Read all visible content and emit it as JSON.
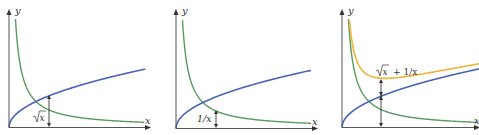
{
  "figure": {
    "panels": [
      {
        "id": "panel-1",
        "axis_labels": {
          "x": "x",
          "y": "y"
        },
        "curves": [
          "sqrt",
          "inverse"
        ],
        "annotation": {
          "label": "√x",
          "target": "sqrt",
          "at_x": 1.48
        }
      },
      {
        "id": "panel-2",
        "axis_labels": {
          "x": "x",
          "y": "y"
        },
        "curves": [
          "sqrt",
          "inverse"
        ],
        "annotation": {
          "label": "1/x",
          "target": "inverse",
          "at_x": 1.48
        }
      },
      {
        "id": "panel-3",
        "axis_labels": {
          "x": "x",
          "y": "y"
        },
        "curves": [
          "sqrt",
          "inverse",
          "sum"
        ],
        "annotation": {
          "label": "√x + 1/x",
          "target": "sum",
          "at_x": 1.44
        }
      }
    ],
    "curve_styles": {
      "sqrt": {
        "name": "√x",
        "color": "#4a63b8"
      },
      "inverse": {
        "name": "1/x",
        "color": "#5a9a5e"
      },
      "sum": {
        "name": "√x + 1/x",
        "color": "#f0b23a"
      }
    }
  },
  "labels": {
    "p1": {
      "y": "y",
      "x": "x",
      "annot_radicand": "x"
    },
    "p2": {
      "y": "y",
      "x": "x",
      "annot": "1/x"
    },
    "p3": {
      "y": "y",
      "x": "x",
      "annot_radicand": "x",
      "annot_rest": "+ 1/x"
    }
  }
}
